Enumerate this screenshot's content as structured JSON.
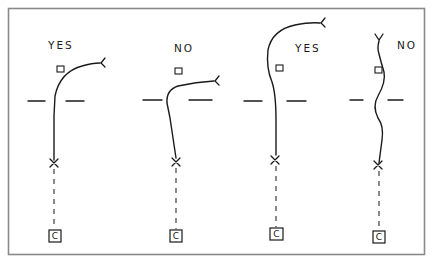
{
  "diagram": {
    "frame": {
      "x": 8.5,
      "y": 8.5,
      "width": 416,
      "height": 246,
      "stroke": "#8a8a8a"
    },
    "panels": [
      {
        "id": "panel-1",
        "verdict": "YES",
        "label": {
          "text": "YES",
          "x": 48,
          "y": 49
        },
        "small_box": {
          "x": 57,
          "y": 66,
          "w": 7,
          "h": 6
        },
        "goal_left": {
          "x1": 28,
          "x2": 45,
          "y": 101
        },
        "goal_right": {
          "x1": 66,
          "x2": 84,
          "y": 101
        },
        "path": "M 54 160 L 54 116 L 55 96 Q 60 72 82 66 Q 92 63 100 63",
        "end_mark": {
          "x": 101,
          "y": 63,
          "type": "fork-right"
        },
        "cross": {
          "x": 54,
          "y": 163
        },
        "dash": {
          "x": 54,
          "y1": 169,
          "y2": 229
        },
        "c_box": {
          "x": 49,
          "y": 230,
          "w": 12,
          "h": 12,
          "text": "C"
        }
      },
      {
        "id": "panel-2",
        "verdict": "NO",
        "label": {
          "text": "NO",
          "x": 174,
          "y": 52
        },
        "small_box": {
          "x": 175,
          "y": 68,
          "w": 7,
          "h": 6
        },
        "goal_left": {
          "x1": 143,
          "x2": 162,
          "y": 100
        },
        "goal_right": {
          "x1": 189,
          "x2": 212,
          "y": 100
        },
        "path": "M 176 158 L 170 118 L 167 103 Q 166 90 178 86 Q 196 82 214 81",
        "end_mark": {
          "x": 215,
          "y": 81,
          "type": "fork-right"
        },
        "cross": {
          "x": 176,
          "y": 162
        },
        "dash": {
          "x": 176,
          "y1": 168,
          "y2": 229
        },
        "c_box": {
          "x": 170,
          "y": 230,
          "w": 12,
          "h": 12,
          "text": "C"
        }
      },
      {
        "id": "panel-3",
        "verdict": "YES",
        "label": {
          "text": "YES",
          "x": 295,
          "y": 52
        },
        "small_box": {
          "x": 276,
          "y": 65,
          "w": 7,
          "h": 6
        },
        "goal_left": {
          "x1": 244,
          "x2": 262,
          "y": 101
        },
        "goal_right": {
          "x1": 287,
          "x2": 306,
          "y": 101
        },
        "path": "M 276 155 L 276 120 Q 276 94 272 82 Q 266 68 268 50 Q 272 30 295 25 Q 310 22 320 23",
        "end_mark": {
          "x": 321,
          "y": 23,
          "type": "fork-right"
        },
        "cross": {
          "x": 275,
          "y": 160
        },
        "dash": {
          "x": 276,
          "y1": 166,
          "y2": 227
        },
        "c_box": {
          "x": 270,
          "y": 228,
          "w": 13,
          "h": 12,
          "text": "C"
        }
      },
      {
        "id": "panel-4",
        "verdict": "NO",
        "label": {
          "text": "NO",
          "x": 397,
          "y": 49
        },
        "small_box": {
          "x": 375,
          "y": 67,
          "w": 7,
          "h": 6
        },
        "goal_left": {
          "x1": 350,
          "x2": 363,
          "y": 100
        },
        "goal_right": {
          "x1": 388,
          "x2": 403,
          "y": 100
        },
        "path": "M 379 163 Q 381 148 382 140 Q 384 126 378 118 Q 372 106 378 96 Q 386 82 384 72 Q 381 62 379 54 Q 377 48 379 41",
        "end_mark": {
          "x": 379,
          "y": 40,
          "type": "fork-up"
        },
        "cross": {
          "x": 378,
          "y": 165
        },
        "dash": {
          "x": 379,
          "y1": 171,
          "y2": 229
        },
        "c_box": {
          "x": 373,
          "y": 231,
          "w": 12,
          "h": 12,
          "text": "C"
        }
      }
    ]
  }
}
